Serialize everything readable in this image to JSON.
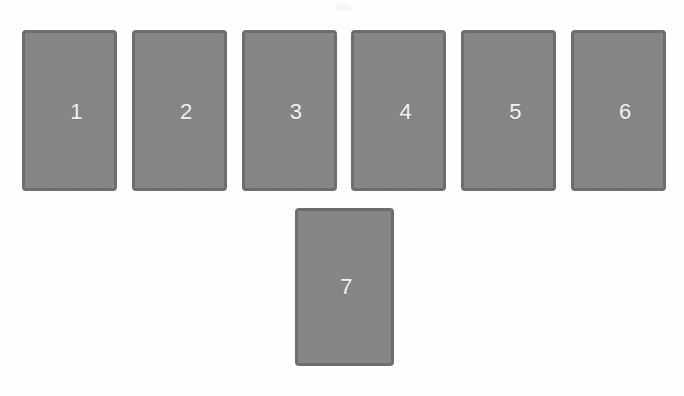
{
  "background_color": "#fefefe",
  "card_style": {
    "fill_color": "#878787",
    "border_color": "#6d6d6d",
    "label_color": "#f2f2f2"
  },
  "rows": {
    "top_row": {
      "name": "top-card-row",
      "cards": [
        {
          "label": "1"
        },
        {
          "label": "2"
        },
        {
          "label": "3"
        },
        {
          "label": "4"
        },
        {
          "label": "5"
        },
        {
          "label": "6"
        }
      ]
    },
    "bottom_row": {
      "name": "bottom-card-row",
      "cards": [
        {
          "label": "7"
        }
      ]
    }
  }
}
